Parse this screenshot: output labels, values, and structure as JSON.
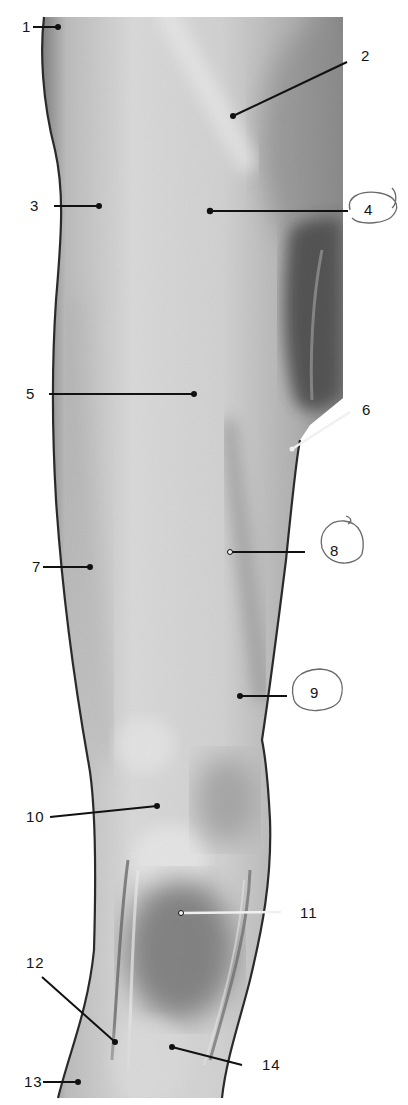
{
  "figure": {
    "colors": {
      "background": "#ffffff",
      "skin_light": "#e6e6e6",
      "skin_mid": "#b4b4b4",
      "skin_dark": "#4a4a4a",
      "outline": "#1e1e1e",
      "leader_line": "#111111",
      "pencil_circle": "#6a6a6a"
    }
  },
  "labels": [
    {
      "id": "1",
      "text": "1",
      "x": 24,
      "y": 22,
      "circled": false
    },
    {
      "id": "2",
      "text": "2",
      "x": 362,
      "y": 50,
      "circled": false
    },
    {
      "id": "3",
      "text": "3",
      "x": 32,
      "y": 198,
      "circled": false
    },
    {
      "id": "4",
      "text": "4",
      "x": 363,
      "y": 203,
      "circled": true
    },
    {
      "id": "5",
      "text": "5",
      "x": 27,
      "y": 386,
      "circled": false
    },
    {
      "id": "6",
      "text": "6",
      "x": 362,
      "y": 404,
      "circled": false
    },
    {
      "id": "7",
      "text": "7",
      "x": 33,
      "y": 559,
      "circled": false
    },
    {
      "id": "8",
      "text": "8",
      "x": 329,
      "y": 543,
      "circled": true
    },
    {
      "id": "9",
      "text": "9",
      "x": 309,
      "y": 684,
      "circled": true
    },
    {
      "id": "10",
      "text": "10",
      "x": 26,
      "y": 807,
      "circled": false
    },
    {
      "id": "11",
      "text": "11",
      "x": 301,
      "y": 906,
      "circled": false
    },
    {
      "id": "12",
      "text": "12",
      "x": 26,
      "y": 956,
      "circled": false
    },
    {
      "id": "13",
      "text": "13",
      "x": 24,
      "y": 1074,
      "circled": false
    },
    {
      "id": "14",
      "text": "14",
      "x": 262,
      "y": 1059,
      "circled": false
    }
  ]
}
